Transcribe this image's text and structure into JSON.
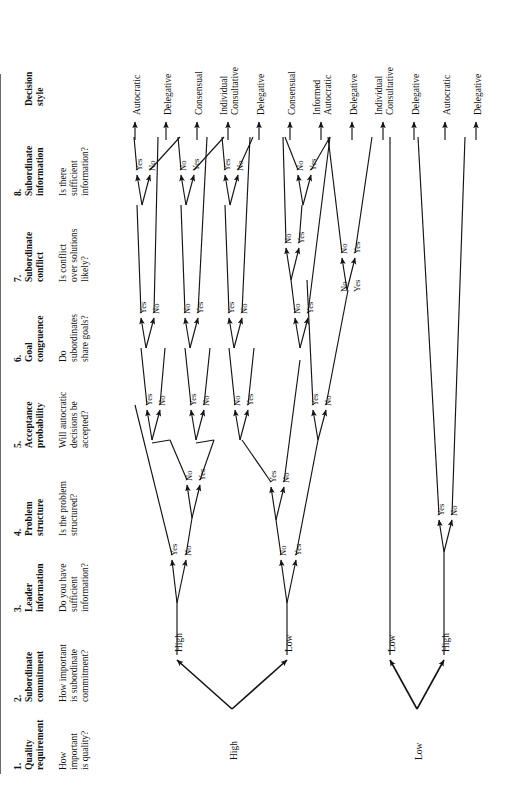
{
  "diagram": {
    "orientation": "rotated-90-counterclockwise",
    "line_color": "#141414",
    "rule_color": "#6a6a6a"
  },
  "columns": [
    {
      "num": "1.",
      "title": "Quality\nrequirement",
      "question": "How\nimportant\nis quality?"
    },
    {
      "num": "2.",
      "title": "Subordinate\ncommitment",
      "question": "How important\nis subordinate\ncommitment?"
    },
    {
      "num": "3.",
      "title": "Leader\ninformation",
      "question": "Do you have\nsufficient\ninformation?"
    },
    {
      "num": "4.",
      "title": "Problem\nstructure",
      "question": "Is the problem\nstructured?"
    },
    {
      "num": "5.",
      "title": "Acceptance\nprobability",
      "question": "Will autocratic\ndecisions be\naccepted?"
    },
    {
      "num": "6.",
      "title": "Goal\ncongruence",
      "question": "Do\nsubordinates\nshare goals?"
    },
    {
      "num": "7.",
      "title": "Subordinate\nconflict",
      "question": "Is conflict\nover solutions\nlikely?"
    },
    {
      "num": "8.",
      "title": "Subordinate\ninformation",
      "question": "Is there\nsufficient\ninformation?"
    },
    {
      "num": "",
      "title": "Decision\nstyle",
      "question": ""
    }
  ],
  "outcomes": [
    {
      "id": 0,
      "label": "Autocratic"
    },
    {
      "id": 1,
      "label": "Delegative"
    },
    {
      "id": 2,
      "label": "Consensual"
    },
    {
      "id": 3,
      "label": "Individual\nConsultative"
    },
    {
      "id": 4,
      "label": "Delegative"
    },
    {
      "id": 5,
      "label": "Consensual"
    },
    {
      "id": 6,
      "label": "Informed\nAutocratic"
    },
    {
      "id": 7,
      "label": "Delegative"
    },
    {
      "id": 8,
      "label": "Individual\nConsultative"
    },
    {
      "id": 9,
      "label": "Delegative"
    },
    {
      "id": 10,
      "label": "Autocratic"
    },
    {
      "id": 11,
      "label": "Delegative"
    }
  ],
  "root_labels": [
    {
      "id": "root-left",
      "label": "High"
    },
    {
      "id": "root-right",
      "label": "Low"
    }
  ],
  "commitment_labels": [
    {
      "id": "c1",
      "label": "High"
    },
    {
      "id": "c2",
      "label": "Low"
    },
    {
      "id": "c3",
      "label": "Low"
    },
    {
      "id": "c4",
      "label": "High"
    }
  ],
  "branch_labels": {
    "col3": [
      {
        "id": "l3a_yes",
        "label": "Yes"
      },
      {
        "id": "l3a_no",
        "label": "No"
      },
      {
        "id": "l3b_no",
        "label": "No"
      },
      {
        "id": "l3b_yes",
        "label": "Yes"
      }
    ],
    "col4": [
      {
        "id": "l4a_no",
        "label": "No"
      },
      {
        "id": "l4a_yes",
        "label": "Yes"
      },
      {
        "id": "l4b_yes",
        "label": "Yes"
      },
      {
        "id": "l4b_no",
        "label": "No"
      }
    ],
    "col5": [
      {
        "id": "l5a_yes",
        "label": "Yes"
      },
      {
        "id": "l5a_no",
        "label": "No"
      },
      {
        "id": "l5b_yes",
        "label": "Yes"
      },
      {
        "id": "l5b_no",
        "label": "No"
      },
      {
        "id": "l5c_no",
        "label": "No"
      },
      {
        "id": "l5c_yes",
        "label": "Yes"
      },
      {
        "id": "l5d_yes",
        "label": "Yes"
      },
      {
        "id": "l5d_no",
        "label": "No"
      }
    ],
    "col6": [
      {
        "id": "l6a_yes",
        "label": "Yes"
      },
      {
        "id": "l6a_no",
        "label": "No"
      },
      {
        "id": "l6b_no",
        "label": "No"
      },
      {
        "id": "l6b_yes",
        "label": "Yes"
      },
      {
        "id": "l6c_yes",
        "label": "Yes"
      },
      {
        "id": "l6c_no",
        "label": "No"
      },
      {
        "id": "l6d_no",
        "label": "No"
      },
      {
        "id": "l6d_yes",
        "label": "Yes"
      },
      {
        "id": "l6e_no",
        "label": "No"
      },
      {
        "id": "l6e_yes",
        "label": "Yes"
      }
    ],
    "col7": [
      {
        "id": "l7a_no",
        "label": "No"
      },
      {
        "id": "l7a_yes",
        "label": "Yes"
      }
    ],
    "col8": [
      {
        "id": "l8a_yes",
        "label": "Yes"
      },
      {
        "id": "l8a_no",
        "label": "No"
      },
      {
        "id": "l8b_no",
        "label": "No"
      },
      {
        "id": "l8b_yes",
        "label": "Yes"
      },
      {
        "id": "l8c_yes",
        "label": "Yes"
      },
      {
        "id": "l8c_no",
        "label": "No"
      },
      {
        "id": "l8d_no",
        "label": "No"
      },
      {
        "id": "l8d_yes",
        "label": "Yes"
      },
      {
        "id": "l8e_no",
        "label": "No"
      },
      {
        "id": "l8e_yes",
        "label": "Yes"
      }
    ]
  }
}
